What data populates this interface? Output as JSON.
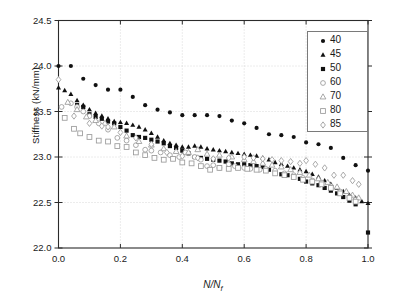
{
  "chart_data": {
    "type": "scatter",
    "title": "",
    "xlabel": "N/N_f",
    "ylabel": "Stiffness (kN/mm)",
    "xlim": [
      0.0,
      1.0
    ],
    "ylim": [
      22.0,
      24.5
    ],
    "xticks": [
      "0.0",
      "0.2",
      "0.4",
      "0.6",
      "0.8",
      "1.0"
    ],
    "xtick_values": [
      0.0,
      0.2,
      0.4,
      0.6,
      0.8,
      1.0
    ],
    "yticks": [
      "22.0",
      "22.5",
      "23.0",
      "23.5",
      "24.0",
      "24.5"
    ],
    "ytick_values": [
      22.0,
      22.5,
      23.0,
      23.5,
      24.0,
      24.5
    ],
    "grid": true,
    "legend_position": "upper-right",
    "legend_title": "",
    "series": [
      {
        "name": "40",
        "marker": "filled-circle",
        "color": "#111111",
        "x": [
          0.0,
          0.04,
          0.08,
          0.12,
          0.16,
          0.2,
          0.24,
          0.28,
          0.32,
          0.36,
          0.4,
          0.44,
          0.48,
          0.52,
          0.56,
          0.6,
          0.64,
          0.68,
          0.72,
          0.76,
          0.8,
          0.84,
          0.88,
          0.92,
          0.96,
          1.0
        ],
        "y": [
          24.0,
          24.0,
          23.86,
          23.79,
          23.74,
          23.74,
          23.66,
          23.57,
          23.52,
          23.49,
          23.46,
          23.46,
          23.46,
          23.45,
          23.4,
          23.37,
          23.32,
          23.25,
          23.24,
          23.22,
          23.16,
          23.14,
          23.1,
          22.99,
          22.91,
          22.85
        ]
      },
      {
        "name": "45",
        "marker": "filled-triangle",
        "color": "#111111",
        "x": [
          0.0,
          0.02,
          0.04,
          0.06,
          0.08,
          0.1,
          0.12,
          0.14,
          0.16,
          0.18,
          0.2,
          0.22,
          0.24,
          0.26,
          0.28,
          0.3,
          0.32,
          0.34,
          0.36,
          0.38,
          0.4,
          0.42,
          0.44,
          0.46,
          0.48,
          0.5,
          0.52,
          0.54,
          0.56,
          0.58,
          0.6,
          0.62,
          0.64,
          0.66,
          0.68,
          0.7,
          0.72,
          0.74,
          0.76,
          0.78,
          0.8,
          0.82,
          0.84,
          0.86,
          0.88,
          0.9,
          0.92,
          0.94,
          0.96,
          0.98,
          1.0
        ],
        "y": [
          23.76,
          23.73,
          23.69,
          23.62,
          23.57,
          23.52,
          23.48,
          23.45,
          23.42,
          23.39,
          23.38,
          23.37,
          23.35,
          23.33,
          23.3,
          23.26,
          23.22,
          23.18,
          23.15,
          23.13,
          23.11,
          23.11,
          23.12,
          23.11,
          23.09,
          23.08,
          23.07,
          23.06,
          23.05,
          23.04,
          23.03,
          23.02,
          23.01,
          22.99,
          22.97,
          22.94,
          22.92,
          22.9,
          22.88,
          22.86,
          22.84,
          22.81,
          22.78,
          22.74,
          22.7,
          22.66,
          22.62,
          22.58,
          22.55,
          22.51,
          22.49
        ]
      },
      {
        "name": "50",
        "marker": "filled-square",
        "color": "#111111",
        "x": [
          0.06,
          0.08,
          0.1,
          0.12,
          0.14,
          0.16,
          0.18,
          0.2,
          0.22,
          0.24,
          0.26,
          0.28,
          0.3,
          0.32,
          0.34,
          0.36,
          0.38,
          0.4,
          0.42,
          0.44,
          0.46,
          0.48,
          0.5,
          0.52,
          0.54,
          0.56,
          0.58,
          0.6,
          0.62,
          0.64,
          0.66,
          0.68,
          0.7,
          0.72,
          0.74,
          0.76,
          0.78,
          0.8,
          0.82,
          0.84,
          0.86,
          0.88,
          0.9,
          0.92,
          0.94,
          0.96,
          1.0
        ],
        "y": [
          23.57,
          23.55,
          23.47,
          23.44,
          23.42,
          23.39,
          23.37,
          23.33,
          23.29,
          23.24,
          23.22,
          23.21,
          23.19,
          23.17,
          23.15,
          23.12,
          23.1,
          23.07,
          23.04,
          23.0,
          22.99,
          22.98,
          22.97,
          22.96,
          22.95,
          22.93,
          22.92,
          22.92,
          22.91,
          22.9,
          22.89,
          22.86,
          22.83,
          22.81,
          22.8,
          22.78,
          22.76,
          22.73,
          22.71,
          22.69,
          22.66,
          22.63,
          22.6,
          22.56,
          22.52,
          22.48,
          22.17
        ]
      },
      {
        "name": "60",
        "marker": "open-circle",
        "color": "#9a9a9a",
        "x": [
          0.01,
          0.04,
          0.06,
          0.08,
          0.1,
          0.13,
          0.16,
          0.19,
          0.22,
          0.25,
          0.28,
          0.3,
          0.33,
          0.36,
          0.39,
          0.41,
          0.44,
          0.46,
          0.48,
          0.5,
          0.52,
          0.55,
          0.57,
          0.6,
          0.62,
          0.65,
          0.67,
          0.7,
          0.73,
          0.76,
          0.79,
          0.82,
          0.85,
          0.88,
          0.91,
          0.94,
          0.96
        ],
        "y": [
          23.55,
          23.59,
          23.55,
          23.5,
          23.45,
          23.37,
          23.3,
          23.21,
          23.18,
          23.13,
          23.08,
          23.07,
          23.05,
          23.02,
          23.0,
          23.05,
          23.0,
          22.97,
          22.9,
          22.91,
          22.88,
          22.92,
          22.9,
          22.88,
          22.87,
          22.86,
          22.87,
          22.85,
          22.82,
          22.8,
          22.77,
          22.74,
          22.72,
          22.68,
          22.62,
          22.56,
          22.53
        ]
      },
      {
        "name": "70",
        "marker": "open-triangle",
        "color": "#9a9a9a",
        "x": [
          0.03,
          0.06,
          0.09,
          0.12,
          0.15,
          0.18,
          0.22,
          0.26,
          0.3,
          0.34,
          0.38,
          0.42,
          0.45,
          0.48,
          0.52,
          0.56,
          0.6,
          0.63,
          0.66,
          0.69,
          0.72,
          0.75,
          0.78,
          0.81,
          0.84,
          0.87,
          0.9,
          0.93,
          0.95,
          0.97
        ],
        "y": [
          23.6,
          23.52,
          23.44,
          23.4,
          23.37,
          23.33,
          23.23,
          23.17,
          23.13,
          23.09,
          23.06,
          23.05,
          23.08,
          23.03,
          23.02,
          23.0,
          22.97,
          22.95,
          22.93,
          22.91,
          22.89,
          22.86,
          22.83,
          22.8,
          22.76,
          22.72,
          22.67,
          22.62,
          22.58,
          22.55
        ]
      },
      {
        "name": "80",
        "marker": "open-square",
        "color": "#9a9a9a",
        "x": [
          0.02,
          0.05,
          0.07,
          0.1,
          0.13,
          0.16,
          0.19,
          0.22,
          0.25,
          0.28,
          0.31,
          0.34,
          0.37,
          0.4,
          0.43,
          0.46,
          0.49,
          0.52,
          0.55,
          0.58,
          0.61,
          0.64,
          0.67,
          0.7,
          0.73,
          0.76,
          0.79,
          0.82,
          0.85,
          0.88,
          0.91,
          0.94,
          0.96
        ],
        "y": [
          23.43,
          23.31,
          23.26,
          23.22,
          23.18,
          23.17,
          23.12,
          23.11,
          23.05,
          23.02,
          22.99,
          22.97,
          22.98,
          22.94,
          22.93,
          22.9,
          22.86,
          22.88,
          22.87,
          22.88,
          22.87,
          22.86,
          22.85,
          22.82,
          22.8,
          22.78,
          22.75,
          22.73,
          22.7,
          22.66,
          22.6,
          22.55,
          22.51
        ]
      },
      {
        "name": "85",
        "marker": "open-diamond",
        "color": "#9a9a9a",
        "x": [
          0.0,
          0.05,
          0.1,
          0.14,
          0.16,
          0.2,
          0.25,
          0.3,
          0.35,
          0.4,
          0.45,
          0.5,
          0.55,
          0.6,
          0.63,
          0.66,
          0.69,
          0.72,
          0.75,
          0.78,
          0.8,
          0.83,
          0.86,
          0.89,
          0.92,
          0.95,
          0.97
        ],
        "y": [
          23.85,
          23.45,
          23.37,
          23.34,
          23.33,
          23.27,
          23.21,
          23.14,
          23.05,
          23.01,
          22.99,
          22.98,
          22.99,
          23.0,
          22.99,
          22.98,
          22.97,
          22.96,
          22.95,
          22.93,
          22.96,
          22.92,
          22.88,
          22.8,
          22.8,
          22.74,
          22.7
        ]
      }
    ]
  },
  "legend": {
    "entries": [
      {
        "label": "40",
        "marker": "filled-circle"
      },
      {
        "label": "45",
        "marker": "filled-triangle"
      },
      {
        "label": "50",
        "marker": "filled-square"
      },
      {
        "label": "60",
        "marker": "open-circle"
      },
      {
        "label": "70",
        "marker": "open-triangle"
      },
      {
        "label": "80",
        "marker": "open-square"
      },
      {
        "label": "85",
        "marker": "open-diamond"
      }
    ]
  }
}
